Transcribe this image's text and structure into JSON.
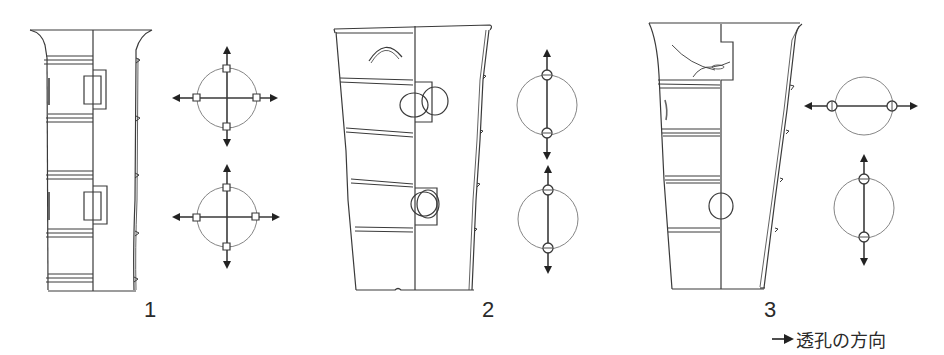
{
  "figures": [
    {
      "number": "1",
      "hole_shape": "square",
      "hole_diagrams": [
        "four-way",
        "four-way"
      ]
    },
    {
      "number": "2",
      "hole_shape": "circle",
      "hole_diagrams": [
        "two-way-vertical",
        "two-way-vertical"
      ]
    },
    {
      "number": "3",
      "hole_shape": "circle",
      "hole_diagrams": [
        "two-way-horizontal",
        "two-way-vertical"
      ]
    }
  ],
  "legend": {
    "icon": "arrow-right-icon",
    "text": "透孔の方向"
  },
  "colors": {
    "line": "#3a3a3a",
    "thin_line": "#777777",
    "background": "#ffffff"
  }
}
